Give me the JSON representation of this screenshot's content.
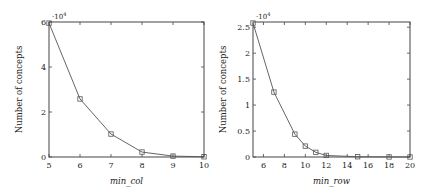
{
  "chart_data": [
    {
      "type": "line",
      "title": "",
      "xlabel": "min_col",
      "ylabel": "Number of concepts",
      "y_multiplier": "·10^4",
      "x": [
        5,
        6,
        7,
        8,
        9,
        10
      ],
      "series": [
        {
          "name": "concepts",
          "values": [
            59500,
            25800,
            10200,
            2200,
            400,
            100
          ],
          "marker": "square"
        }
      ],
      "xlim": [
        5,
        10
      ],
      "ylim": [
        0,
        60000
      ],
      "xticks": [
        "5",
        "6",
        "7",
        "8",
        "9",
        "10"
      ],
      "yticks": [
        "0",
        "2",
        "4",
        "6"
      ],
      "grid": false,
      "legend": null
    },
    {
      "type": "line",
      "title": "",
      "xlabel": "min_row",
      "ylabel": "Number of concepts",
      "y_multiplier": "·10^4",
      "x": [
        5,
        7,
        9,
        10,
        11,
        12,
        15,
        18,
        20
      ],
      "series": [
        {
          "name": "concepts",
          "values": [
            25800,
            12500,
            4400,
            2100,
            900,
            300,
            50,
            10,
            5
          ],
          "marker": "square"
        }
      ],
      "xlim": [
        5,
        20
      ],
      "ylim": [
        0,
        26000
      ],
      "xticks": [
        "6",
        "8",
        "10",
        "12",
        "14",
        "16",
        "18",
        "20"
      ],
      "yticks": [
        "0",
        "0.5",
        "1",
        "1.5",
        "2",
        "2.5"
      ],
      "grid": false,
      "legend": null
    }
  ],
  "labels": {
    "left_x": "min_col",
    "right_x": "min_row",
    "y": "Number of concepts",
    "exp": "·10",
    "exp_sup": "4"
  }
}
